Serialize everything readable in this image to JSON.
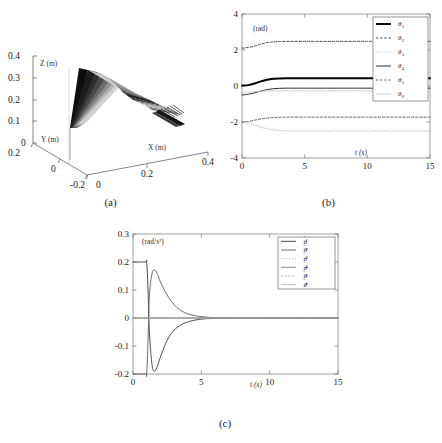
{
  "figure": {
    "panels": [
      {
        "id": "a",
        "caption": "(a)"
      },
      {
        "id": "b",
        "caption": "(b)"
      },
      {
        "id": "c",
        "caption": "(c)"
      }
    ]
  },
  "panel_a": {
    "caption": "(a)",
    "z_axis_label": "Z (m)",
    "y_axis_label": "Y (m)",
    "x_axis_label": "X (m)",
    "z_ticks": [
      "0.4",
      "0.3",
      "0.2",
      "0.1",
      "0"
    ],
    "y_ticks": [
      "0.2",
      "0",
      "-0.2"
    ],
    "x_ticks": [
      "0",
      "0.2",
      "0.4"
    ],
    "description": "3D manipulator motion trace"
  },
  "panel_b": {
    "caption": "(b)",
    "unit_label": "(rad)",
    "x_label": "t (s)"
  },
  "panel_c": {
    "caption": "(c)",
    "unit_label": "(rad/s²)",
    "x_label": "t (s)"
  },
  "chart_data": [
    {
      "panel": "b",
      "type": "line",
      "title": "",
      "xlabel": "t (s)",
      "ylabel": "(rad)",
      "xlim": [
        0,
        15
      ],
      "ylim": [
        -4,
        4
      ],
      "xticks": [
        0,
        5,
        10,
        15
      ],
      "yticks": [
        -4,
        -2,
        0,
        2,
        4
      ],
      "grid": false,
      "legend_position": "top-right",
      "x": [
        0,
        0.5,
        1,
        1.5,
        2,
        2.5,
        3,
        3.5,
        4,
        5,
        6,
        7.5,
        10,
        12.5,
        15
      ],
      "series": [
        {
          "name": "θ₁",
          "label_base": "θ",
          "label_sub": "1",
          "style": "solid",
          "width": 1.9,
          "color": "#000000",
          "values": [
            0.02,
            0.05,
            0.14,
            0.26,
            0.35,
            0.4,
            0.42,
            0.43,
            0.43,
            0.43,
            0.43,
            0.43,
            0.43,
            0.43,
            0.43
          ]
        },
        {
          "name": "θ₂",
          "label_base": "θ",
          "label_sub": "2",
          "style": "dashed",
          "width": 0.9,
          "color": "#333333",
          "values": [
            2.1,
            2.14,
            2.22,
            2.33,
            2.41,
            2.45,
            2.47,
            2.48,
            2.48,
            2.48,
            2.48,
            2.48,
            2.48,
            2.48,
            2.48
          ]
        },
        {
          "name": "θ₃",
          "label_base": "θ",
          "label_sub": "3",
          "style": "dotted",
          "width": 0.9,
          "color": "#b0b0b0",
          "values": [
            -2.02,
            -2.06,
            -2.16,
            -2.28,
            -2.38,
            -2.44,
            -2.47,
            -2.49,
            -2.5,
            -2.5,
            -2.5,
            -2.5,
            -2.5,
            -2.5,
            -2.5
          ]
        },
        {
          "name": "θ₄",
          "label_base": "θ",
          "label_sub": "4",
          "style": "solid",
          "width": 1.0,
          "color": "#2b2b2b",
          "values": [
            -0.5,
            -0.46,
            -0.38,
            -0.28,
            -0.2,
            -0.15,
            -0.13,
            -0.12,
            -0.12,
            -0.12,
            -0.12,
            -0.12,
            -0.12,
            -0.12,
            -0.12
          ]
        },
        {
          "name": "θ₅",
          "label_base": "θ",
          "label_sub": "5",
          "style": "dashed",
          "width": 0.9,
          "color": "#555555",
          "values": [
            -2.0,
            -1.97,
            -1.9,
            -1.83,
            -1.78,
            -1.75,
            -1.74,
            -1.73,
            -1.73,
            -1.73,
            -1.73,
            -1.73,
            -1.73,
            -1.73,
            -1.73
          ]
        },
        {
          "name": "θ₆",
          "label_base": "θ",
          "label_sub": "6",
          "style": "solid",
          "width": 0.9,
          "color": "#c8c8c8",
          "values": [
            -0.36,
            -0.34,
            -0.31,
            -0.29,
            -0.28,
            -0.27,
            -0.27,
            -0.27,
            -0.27,
            -0.27,
            -0.27,
            -0.27,
            -0.27,
            -0.27,
            -0.27
          ]
        }
      ]
    },
    {
      "panel": "c",
      "type": "line",
      "title": "",
      "xlabel": "t (s)",
      "ylabel": "(rad/s²)",
      "xlim": [
        0,
        15
      ],
      "ylim": [
        -0.2,
        0.3
      ],
      "xticks": [
        0,
        5,
        10,
        15
      ],
      "yticks": [
        -0.2,
        -0.1,
        0,
        0.1,
        0.2,
        0.3
      ],
      "grid": false,
      "legend_position": "top-right",
      "x": [
        0,
        0.9,
        1.0,
        1.1,
        1.2,
        1.4,
        1.6,
        1.8,
        2.0,
        2.4,
        2.8,
        3.2,
        3.6,
        4.0,
        4.5,
        5.0,
        6.0,
        7.5,
        10,
        12.5,
        15
      ],
      "series": [
        {
          "name": "θ̈₁",
          "label_base": "θ",
          "label_sub": "1",
          "style": "solid",
          "width": 0.9,
          "color": "#3a3a3a",
          "values": [
            0.2,
            0.2,
            0.2,
            0.1,
            -0.05,
            -0.17,
            -0.19,
            -0.17,
            -0.14,
            -0.09,
            -0.055,
            -0.035,
            -0.022,
            -0.014,
            -0.008,
            -0.004,
            -0.001,
            0,
            0,
            0,
            0
          ]
        },
        {
          "name": "θ̈₂",
          "label_base": "θ",
          "label_sub": "2",
          "style": "solid",
          "width": 0.9,
          "color": "#5a5a5a",
          "values": [
            -0.2,
            -0.2,
            -0.2,
            -0.08,
            0.08,
            0.16,
            0.17,
            0.155,
            0.13,
            0.09,
            0.06,
            0.038,
            0.024,
            0.015,
            0.009,
            0.005,
            0.001,
            0,
            0,
            0,
            0
          ]
        },
        {
          "name": "θ̈₃",
          "label_base": "θ",
          "label_sub": "3",
          "style": "dotted",
          "width": 0.8,
          "color": "#8a8a8a",
          "values": [
            0.0,
            0.0,
            0.0,
            0.0,
            0.0,
            0.0,
            0.0,
            0.0,
            0.0,
            0.0,
            0.0,
            0.0,
            0.0,
            0.0,
            0.0,
            0.0,
            0.0,
            0,
            0,
            0,
            0
          ]
        },
        {
          "name": "θ̈₄",
          "label_base": "θ",
          "label_sub": "4",
          "style": "solid",
          "width": 0.8,
          "color": "#707070",
          "values": [
            0.0,
            0.0,
            0.0,
            0.0,
            0.0,
            0.0,
            0.0,
            0.0,
            0.0,
            0.0,
            0.0,
            0.0,
            0.0,
            0.0,
            0.0,
            0.0,
            0.0,
            0,
            0,
            0,
            0
          ]
        },
        {
          "name": "θ̈₅",
          "label_base": "θ",
          "label_sub": "5",
          "style": "dashed",
          "width": 0.8,
          "color": "#999999",
          "values": [
            0.0,
            0.0,
            0.0,
            0.0,
            0.0,
            0.0,
            0.0,
            0.0,
            0.0,
            0.0,
            0.0,
            0.0,
            0.0,
            0.0,
            0.0,
            0.0,
            0.0,
            0,
            0,
            0,
            0
          ]
        },
        {
          "name": "θ̈₆",
          "label_base": "θ",
          "label_sub": "6",
          "style": "solid",
          "width": 0.8,
          "color": "#aaaaaa",
          "values": [
            0.0,
            0.0,
            0.0,
            0.0,
            0.0,
            0.0,
            0.0,
            0.0,
            0.0,
            0.0,
            0.0,
            0.0,
            0.0,
            0.0,
            0.0,
            0.0,
            0.0,
            0,
            0,
            0,
            0
          ]
        }
      ]
    }
  ]
}
